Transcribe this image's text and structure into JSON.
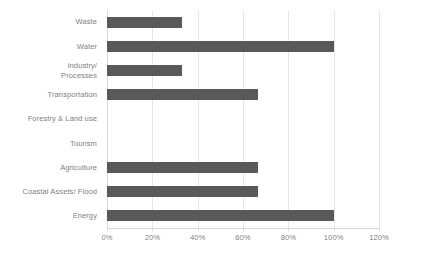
{
  "chart_data": {
    "type": "bar",
    "orientation": "horizontal",
    "title": "",
    "xlabel": "",
    "ylabel": "",
    "categories": [
      "Waste",
      "Water",
      "Industry/\nProcesses",
      "Transportation",
      "Forestry & Land use",
      "Tourism",
      "Agriculture",
      "Coastal Assets/ Flood",
      "Energy"
    ],
    "values": [
      33.3,
      100,
      33.3,
      66.7,
      0,
      0,
      66.7,
      66.7,
      100
    ],
    "value_unit": "%",
    "xlim": [
      0,
      120
    ],
    "xticks": [
      0,
      20,
      40,
      60,
      80,
      100,
      120
    ],
    "xtick_labels": [
      "0%",
      "20%",
      "40%",
      "60%",
      "80%",
      "100%",
      "120%"
    ],
    "grid": "vertical",
    "legend": "none",
    "bar_color": "#595959",
    "gridline_color": "#e6e6e6",
    "label_color": "#7f7f7f"
  }
}
